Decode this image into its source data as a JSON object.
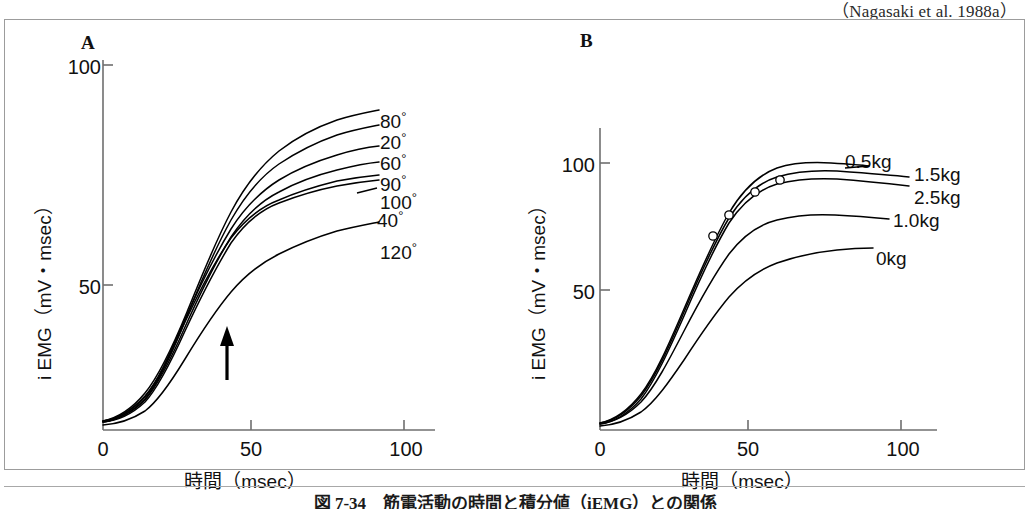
{
  "citation": "（Nagasaki et al. 1988a）",
  "caption": "図 7-34　筋電活動の時間と積分値（iEMG）との関係",
  "colors": {
    "ink": "#111111",
    "frame": "#9c9c9c",
    "axis": "#6f6f6f",
    "curve": "#000000",
    "background": "#ffffff"
  },
  "panels": [
    {
      "letter": "A",
      "axis_x": {
        "title": "時間（msec）",
        "ticks": [
          "0",
          "50",
          "100"
        ],
        "tick_values": [
          0,
          50,
          100
        ],
        "range": [
          0,
          118
        ]
      },
      "axis_y": {
        "title": "i EMG（mV・msec）",
        "ticks": [
          "50",
          "100"
        ],
        "tick_values": [
          50,
          100
        ],
        "range": [
          0,
          108
        ]
      },
      "annotation": "arrow-marker",
      "annotation_x": 44,
      "curve_labels": [
        "80°",
        "20°",
        "60°",
        "90°",
        "100°",
        "40°",
        "120°"
      ]
    },
    {
      "letter": "B",
      "axis_x": {
        "title": "時間（msec）",
        "ticks": [
          "0",
          "50",
          "100"
        ],
        "tick_values": [
          0,
          50,
          100
        ],
        "range": [
          0,
          118
        ]
      },
      "axis_y": {
        "title": "i EMG（mV・msec）",
        "ticks": [
          "50",
          "100"
        ],
        "tick_values": [
          50,
          100
        ],
        "range": [
          0,
          118
        ]
      },
      "curve_labels": [
        "0.5kg",
        "1.5kg",
        "2.5kg",
        "1.0kg",
        "0kg"
      ]
    }
  ],
  "chart_data": [
    {
      "type": "line",
      "panel": "A",
      "title": "",
      "xlabel": "時間（msec）",
      "ylabel": "i EMG（mV・msec）",
      "xlim": [
        0,
        118
      ],
      "ylim": [
        0,
        108
      ],
      "xticks": [
        0,
        50,
        100
      ],
      "yticks": [
        50,
        100
      ],
      "grid": false,
      "legend": "curve-end-labels",
      "annotations": [
        {
          "type": "arrow",
          "x": 44,
          "y": 18,
          "direction": "up",
          "label": ""
        }
      ],
      "series": [
        {
          "name": "80°",
          "x": [
            0,
            10,
            20,
            30,
            40,
            45,
            50,
            55,
            60,
            70,
            80,
            90,
            100,
            110
          ],
          "y": [
            2,
            5,
            11,
            21,
            36,
            44,
            53,
            61,
            68,
            77,
            82,
            86,
            88,
            90
          ]
        },
        {
          "name": "20°",
          "x": [
            0,
            10,
            20,
            30,
            40,
            45,
            50,
            55,
            60,
            70,
            80,
            90,
            100,
            110
          ],
          "y": [
            2,
            4,
            9,
            18,
            33,
            42,
            51,
            59,
            65,
            73,
            78,
            82,
            84,
            86
          ]
        },
        {
          "name": "60°",
          "x": [
            0,
            10,
            20,
            30,
            40,
            45,
            50,
            55,
            60,
            70,
            80,
            90,
            100,
            110
          ],
          "y": [
            2,
            5,
            10,
            19,
            32,
            39,
            47,
            54,
            60,
            68,
            74,
            78,
            80,
            82
          ]
        },
        {
          "name": "90°",
          "x": [
            0,
            10,
            20,
            30,
            40,
            45,
            50,
            55,
            60,
            70,
            80,
            90,
            100,
            110
          ],
          "y": [
            2,
            4,
            9,
            18,
            31,
            38,
            45,
            51,
            56,
            63,
            68,
            72,
            74,
            76
          ]
        },
        {
          "name": "100°",
          "x": [
            0,
            10,
            20,
            30,
            40,
            45,
            50,
            55,
            60,
            70,
            80,
            90,
            100,
            110
          ],
          "y": [
            2,
            5,
            10,
            19,
            32,
            39,
            45,
            50,
            54,
            60,
            65,
            69,
            71,
            73
          ]
        },
        {
          "name": "40°",
          "x": [
            0,
            10,
            20,
            30,
            40,
            45,
            50,
            55,
            60,
            70,
            80,
            90,
            100,
            110
          ],
          "y": [
            2,
            4,
            9,
            17,
            30,
            37,
            44,
            49,
            53,
            59,
            64,
            68,
            70,
            72
          ]
        },
        {
          "name": "120°",
          "x": [
            0,
            10,
            20,
            30,
            40,
            45,
            50,
            55,
            60,
            70,
            80,
            90,
            100,
            110
          ],
          "y": [
            1,
            3,
            7,
            14,
            24,
            30,
            36,
            41,
            45,
            51,
            55,
            58,
            60,
            61
          ]
        }
      ]
    },
    {
      "type": "line",
      "panel": "B",
      "title": "",
      "xlabel": "時間（msec）",
      "ylabel": "i EMG（mV・msec）",
      "xlim": [
        0,
        118
      ],
      "ylim": [
        0,
        118
      ],
      "xticks": [
        0,
        50,
        100
      ],
      "yticks": [
        50,
        100
      ],
      "grid": false,
      "legend": "curve-end-labels",
      "markers": "open-circle",
      "series": [
        {
          "name": "0.5kg",
          "x": [
            0,
            10,
            20,
            30,
            40,
            45,
            50,
            55,
            60,
            70,
            80,
            90,
            100,
            112
          ],
          "y": [
            2,
            5,
            12,
            23,
            40,
            49,
            58,
            67,
            74,
            85,
            92,
            96,
            99,
            101
          ],
          "markers_at": [
            [
              52,
              61
            ],
            [
              65,
              79
            ]
          ]
        },
        {
          "name": "1.5kg",
          "x": [
            0,
            10,
            20,
            30,
            40,
            45,
            50,
            55,
            60,
            70,
            80,
            90,
            100,
            112
          ],
          "y": [
            2,
            5,
            11,
            22,
            39,
            48,
            57,
            65,
            72,
            82,
            89,
            93,
            96,
            98
          ],
          "markers_at": [
            [
              49,
              56
            ]
          ]
        },
        {
          "name": "2.5kg",
          "x": [
            0,
            10,
            20,
            30,
            40,
            45,
            50,
            55,
            60,
            70,
            80,
            90,
            100,
            112
          ],
          "y": [
            2,
            4,
            10,
            21,
            38,
            47,
            56,
            64,
            71,
            81,
            88,
            92,
            95,
            97
          ],
          "markers_at": [
            [
              61,
              74
            ]
          ]
        },
        {
          "name": "1.0kg",
          "x": [
            0,
            10,
            20,
            30,
            40,
            45,
            50,
            55,
            60,
            70,
            80,
            90,
            100,
            112
          ],
          "y": [
            2,
            4,
            10,
            20,
            34,
            42,
            50,
            57,
            63,
            71,
            77,
            80,
            82,
            83
          ],
          "markers_at": []
        },
        {
          "name": "0kg",
          "x": [
            0,
            10,
            20,
            30,
            40,
            45,
            50,
            55,
            60,
            70,
            80,
            90,
            100,
            112
          ],
          "y": [
            1,
            3,
            7,
            14,
            25,
            31,
            37,
            43,
            48,
            56,
            61,
            65,
            67,
            68
          ],
          "markers_at": []
        }
      ]
    }
  ]
}
